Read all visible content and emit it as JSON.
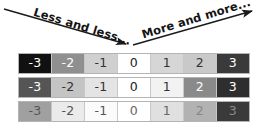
{
  "figure": {
    "background": "#ffffff"
  },
  "annotations": {
    "left": {
      "id": "less-and-less",
      "text": "Less and less...",
      "direction": "left-to-right-descending",
      "arrowhead": "right"
    },
    "right": {
      "id": "more-and-more",
      "text": "More and more...",
      "direction": "left-to-right-ascending",
      "arrowhead": "right"
    },
    "stroke_color": "#1a1a1a"
  },
  "scale": {
    "labels": [
      "-3",
      "-2",
      "-1",
      "0",
      "1",
      "2",
      "3"
    ],
    "rows": [
      {
        "name": "row-1",
        "swatches": [
          "#111111",
          "#8f8f8f",
          "#d0d0d0",
          "#ffffff",
          "#d6d6d6",
          "#c9c9c9",
          "#3a3a3a"
        ],
        "text_colors": [
          "#ffffff",
          "#ffffff",
          "#333333",
          "#222222",
          "#333333",
          "#333333",
          "#ffffff"
        ]
      },
      {
        "name": "row-2",
        "swatches": [
          "#555555",
          "#c4c4c4",
          "#e4e4e4",
          "#ffffff",
          "#f2f2f2",
          "#8a8a8a",
          "#2e2e2e"
        ],
        "text_colors": [
          "#ffffff",
          "#333333",
          "#333333",
          "#222222",
          "#333333",
          "#ffffff",
          "#ffffff"
        ]
      },
      {
        "name": "row-3",
        "swatches": [
          "#a0a0a0",
          "#ebebeb",
          "#fbfbfb",
          "#ffffff",
          "#e0e0e0",
          "#b2b2b2",
          "#3a3a3a"
        ],
        "text_colors": [
          "#555555",
          "#555555",
          "#555555",
          "#666666",
          "#666666",
          "#888888",
          "#8a8a8a"
        ]
      }
    ]
  }
}
